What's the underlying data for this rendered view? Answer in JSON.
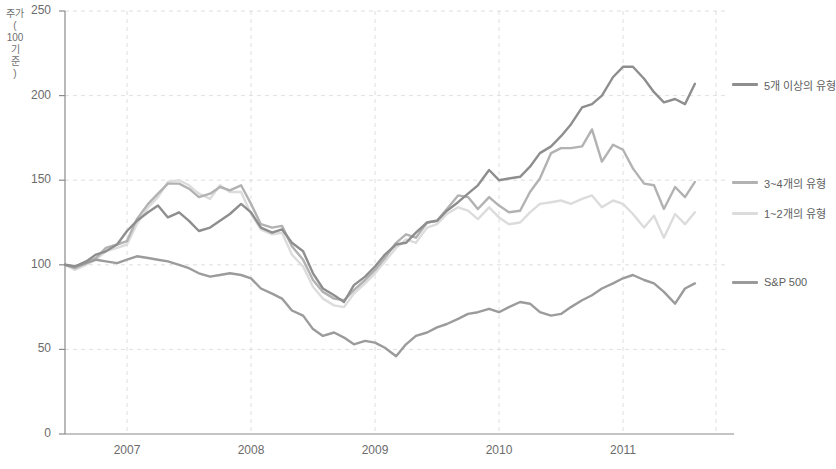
{
  "chart_data": {
    "type": "line",
    "title": "",
    "xlabel": "",
    "ylabel": "주가\n(\n100\n기\n준\n)",
    "ylabel_plain": "주가 (100 기준)",
    "ylim": [
      0,
      250
    ],
    "yticks": [
      0,
      50,
      100,
      150,
      200,
      250
    ],
    "xlim": [
      2006.5,
      2011.75
    ],
    "xticks": [
      2007,
      2008,
      2009,
      2010,
      2011
    ],
    "xtick_labels": [
      "2007",
      "2008",
      "2009",
      "2010",
      "2011"
    ],
    "grid": true,
    "legend_position": "right",
    "x": [
      2006.5,
      2006.58,
      2006.67,
      2006.75,
      2006.83,
      2006.92,
      2007.0,
      2007.08,
      2007.17,
      2007.25,
      2007.33,
      2007.42,
      2007.5,
      2007.58,
      2007.67,
      2007.75,
      2007.83,
      2007.92,
      2008.0,
      2008.08,
      2008.17,
      2008.25,
      2008.33,
      2008.42,
      2008.5,
      2008.58,
      2008.67,
      2008.75,
      2008.83,
      2008.92,
      2009.0,
      2009.08,
      2009.17,
      2009.25,
      2009.33,
      2009.42,
      2009.5,
      2009.58,
      2009.67,
      2009.75,
      2009.83,
      2009.92,
      2010.0,
      2010.08,
      2010.17,
      2010.25,
      2010.33,
      2010.42,
      2010.5,
      2010.58,
      2010.67,
      2010.75,
      2010.83,
      2010.92,
      2011.0,
      2011.08,
      2011.17,
      2011.25,
      2011.33,
      2011.42,
      2011.5,
      2011.58
    ],
    "series": [
      {
        "name": "5개 이상의 유형",
        "color": "#8e8e8e",
        "values": [
          100,
          99,
          102,
          106,
          108,
          112,
          120,
          126,
          131,
          135,
          128,
          131,
          126,
          120,
          122,
          126,
          130,
          136,
          131,
          122,
          119,
          121,
          113,
          108,
          95,
          86,
          82,
          78,
          88,
          93,
          99,
          106,
          112,
          113,
          119,
          125,
          126,
          132,
          137,
          142,
          147,
          156,
          150,
          151,
          152,
          158,
          166,
          170,
          176,
          183,
          193,
          195,
          200,
          211,
          217,
          217,
          210,
          202,
          196,
          198,
          195,
          207
        ]
      },
      {
        "name": "3~4개의 유형",
        "color": "#b2b2b2",
        "values": [
          100,
          98,
          101,
          104,
          110,
          112,
          114,
          127,
          136,
          142,
          148,
          148,
          145,
          140,
          142,
          146,
          144,
          147,
          136,
          124,
          122,
          123,
          111,
          103,
          91,
          84,
          80,
          79,
          85,
          91,
          97,
          104,
          113,
          118,
          116,
          125,
          126,
          133,
          141,
          140,
          133,
          140,
          135,
          131,
          132,
          143,
          151,
          166,
          169,
          169,
          170,
          180,
          161,
          171,
          168,
          157,
          148,
          147,
          133,
          146,
          140,
          149
        ]
      },
      {
        "name": "1~2개의 유형",
        "color": "#dcdcdc",
        "values": [
          100,
          97,
          100,
          103,
          108,
          110,
          112,
          124,
          134,
          140,
          149,
          150,
          147,
          142,
          139,
          147,
          143,
          143,
          130,
          121,
          118,
          119,
          106,
          99,
          87,
          80,
          76,
          75,
          83,
          89,
          95,
          102,
          110,
          115,
          113,
          122,
          124,
          130,
          134,
          132,
          127,
          134,
          128,
          124,
          125,
          131,
          136,
          137,
          138,
          136,
          139,
          141,
          134,
          138,
          136,
          130,
          122,
          129,
          116,
          130,
          124,
          131
        ]
      },
      {
        "name": "S&P 500",
        "color": "#9b9b9b",
        "values": [
          100,
          99,
          101,
          103,
          102,
          101,
          103,
          105,
          104,
          103,
          102,
          100,
          98,
          95,
          93,
          94,
          95,
          94,
          92,
          86,
          83,
          80,
          73,
          70,
          62,
          58,
          60,
          57,
          53,
          55,
          54,
          51,
          46,
          53,
          58,
          60,
          63,
          65,
          68,
          71,
          72,
          74,
          72,
          75,
          78,
          77,
          72,
          70,
          71,
          75,
          79,
          82,
          86,
          89,
          92,
          94,
          91,
          89,
          84,
          77,
          86,
          89
        ]
      }
    ]
  },
  "axis": {
    "y_tick_labels": [
      "250",
      "200",
      "150",
      "100",
      "50",
      "0"
    ],
    "x_tick_labels": [
      "2007",
      "2008",
      "2009",
      "2010",
      "2011"
    ]
  },
  "legend": {
    "items": [
      {
        "label": "5개 이상의 유형",
        "color": "#8e8e8e"
      },
      {
        "label": "3~4개의 유형",
        "color": "#b2b2b2"
      },
      {
        "label": "1~2개의 유형",
        "color": "#dcdcdc"
      },
      {
        "label": "S&P 500",
        "color": "#9b9b9b"
      }
    ]
  },
  "colors": {
    "grid": "#e0dede",
    "axis": "#8a8a8a",
    "text": "#6b6b6b"
  }
}
